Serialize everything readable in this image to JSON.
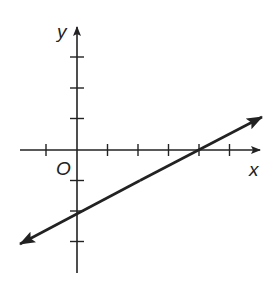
{
  "diagram": {
    "type": "coordinate-plane-line",
    "labels": {
      "x_axis": "x",
      "y_axis": "y",
      "origin": "O"
    },
    "tick_spacing_units": 1,
    "x_ticks": [
      -1,
      1,
      2,
      3,
      4,
      5
    ],
    "y_ticks": [
      3,
      2,
      1,
      -1,
      -2,
      -3
    ],
    "line": {
      "x_intercept": 4,
      "y_intercept": -2,
      "slope": 0.5,
      "equation": "y = 0.5x - 2",
      "arrows_both_ends": true
    },
    "colors": {
      "ink": "#222222",
      "background": "#ffffff"
    }
  }
}
